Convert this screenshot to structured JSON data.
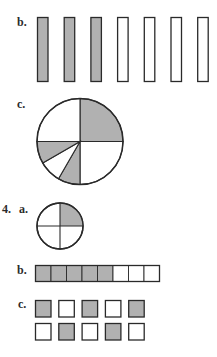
{
  "colors": {
    "shaded": "#b1b1b1",
    "stroke": "#2a2a2a",
    "unshaded": "#ffffff"
  },
  "problem3": {
    "b": {
      "label": "b.",
      "type": "bars",
      "total": 7,
      "shaded": 3
    },
    "c": {
      "label": "c.",
      "type": "pie",
      "wedges": [
        {
          "from": 0,
          "to": 90,
          "shaded": true
        },
        {
          "from": 90,
          "to": 180,
          "shaded": false
        },
        {
          "from": 180,
          "to": 210,
          "shaded": true
        },
        {
          "from": 210,
          "to": 240,
          "shaded": false
        },
        {
          "from": 240,
          "to": 270,
          "shaded": true
        },
        {
          "from": 270,
          "to": 360,
          "shaded": false
        }
      ]
    }
  },
  "problem4": {
    "number": "4.",
    "a": {
      "label": "a.",
      "type": "circle-quarters",
      "total": 4,
      "shaded": 1
    },
    "b": {
      "label": "b.",
      "type": "strip",
      "total": 8,
      "shaded": 5
    },
    "c": {
      "label": "c.",
      "type": "squares",
      "rows": [
        [
          true,
          false,
          true,
          false,
          true
        ],
        [
          false,
          true,
          false,
          true,
          false
        ]
      ]
    }
  }
}
